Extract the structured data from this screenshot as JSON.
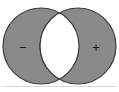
{
  "diagram": {
    "type": "venn-two-circle",
    "canvas": {
      "width": 119,
      "height": 92,
      "background_color": "#ffffff"
    },
    "style": {
      "fill_color": "#8a8a8a",
      "stroke_color": "#3b3b3b",
      "stroke_width": 1.2,
      "intersection_fill_color": "#ffffff",
      "label_color": "#1a1a1a",
      "baseline_color": "#d8d8d8"
    },
    "shapes": [
      {
        "name": "left-circle",
        "cx": 41,
        "cy": 46,
        "r": 38,
        "fill": "#8a8a8a",
        "label": "−",
        "label_name": "minus-sign",
        "label_x": 23,
        "label_y": 47
      },
      {
        "name": "right-circle",
        "cx": 78,
        "cy": 46,
        "r": 38,
        "fill": "#8a8a8a",
        "label": "+",
        "label_name": "plus-sign",
        "label_x": 96,
        "label_y": 47
      }
    ],
    "intersection": {
      "name": "lens-overlap",
      "fill": "#ffffff",
      "label": ""
    },
    "baseline": {
      "visible": true,
      "y": 86
    }
  }
}
